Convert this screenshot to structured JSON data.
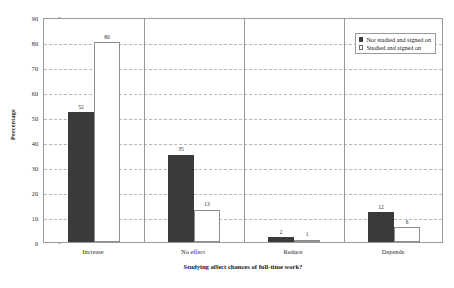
{
  "chart_data": {
    "type": "bar",
    "title": "",
    "subtitle": "",
    "xlabel": "Studying affect chances of full-time work?",
    "ylabel": "Percentage",
    "categories": [
      "Increase",
      "No effect",
      "Reduce",
      "Depends"
    ],
    "series": [
      {
        "name": "Not studied and signed on",
        "values": [
          52,
          35,
          2,
          12
        ],
        "color": "#3a3a3a",
        "style": "filled"
      },
      {
        "name": "Studied and signed on",
        "values": [
          80,
          13,
          1,
          6
        ],
        "color": "#ffffff",
        "style": "outlined"
      }
    ],
    "ylim": [
      0,
      90
    ],
    "ytick_step": 10,
    "yticks": [
      0,
      10,
      20,
      30,
      40,
      50,
      60,
      70,
      80,
      90
    ],
    "ytick_labels": [
      "0",
      "10",
      "20",
      "30",
      "40",
      "50",
      "60",
      "70",
      "80",
      "90"
    ],
    "grid": true,
    "grid_style": "dashed",
    "grid_axis": "y",
    "grid_color": "#b9b9b9",
    "data_labels": true,
    "legend_position": "top-right",
    "legend_inside_plot": true,
    "plot_border_color": "#9a9a9a",
    "background_color": "#ffffff",
    "category_dividers": true
  }
}
